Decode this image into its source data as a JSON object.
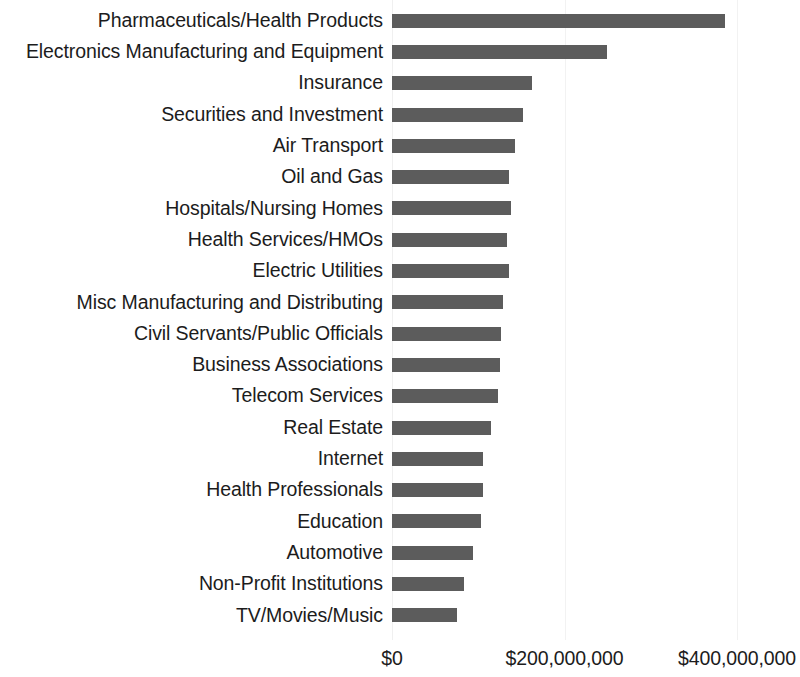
{
  "chart_data": {
    "type": "bar",
    "orientation": "horizontal",
    "title": "",
    "subtitle": "",
    "xlabel": "",
    "ylabel": "",
    "xlim": [
      0,
      473000000
    ],
    "grid": true,
    "legend": null,
    "value_prefix": "$",
    "categories": [
      "Pharmaceuticals/Health Products",
      "Electronics Manufacturing and Equipment",
      "Insurance",
      "Securities and Investment",
      "Air Transport",
      "Oil and Gas",
      "Hospitals/Nursing Homes",
      "Health Services/HMOs",
      "Electric Utilities",
      "Misc Manufacturing and Distributing",
      "Civil Servants/Public Officials",
      "Business Associations",
      "Telecom Services",
      "Real Estate",
      "Internet",
      "Health Professionals",
      "Education",
      "Automotive",
      "Non-Profit Institutions",
      "TV/Movies/Music"
    ],
    "values": [
      386000000,
      249000000,
      162000000,
      152000000,
      143000000,
      136000000,
      138000000,
      133000000,
      136000000,
      129000000,
      126000000,
      125000000,
      123000000,
      115000000,
      105000000,
      105000000,
      103000000,
      94000000,
      83000000,
      75000000
    ],
    "xticks": [
      0,
      200000000,
      400000000
    ],
    "xtick_labels": [
      "$0",
      "$200,000,000",
      "$400,000,000"
    ],
    "colors": {
      "bar": "#5c5c5c",
      "gridline": "#f2f2f2",
      "text": "#1c1c1c",
      "background": "#ffffff"
    }
  }
}
